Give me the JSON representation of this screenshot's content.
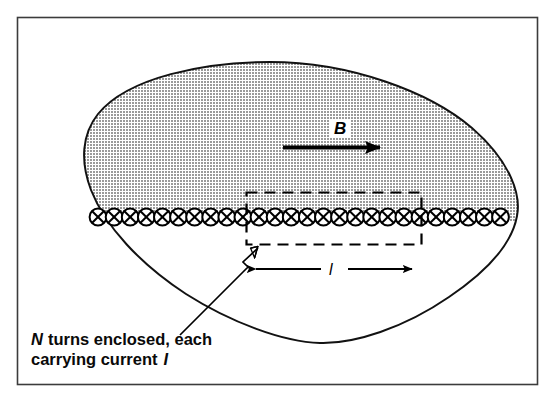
{
  "figure": {
    "kind": "physics-diagram",
    "frame": {
      "border_color": "#3c3c3c",
      "background_color": "#ffffff"
    },
    "region": {
      "name": "magnetic-field-region-blob",
      "fill_color": "#b0b0b0",
      "outline_color": "#1a1a1a"
    },
    "field_arrow": {
      "label": "B",
      "description": "magnetic field direction arrow pointing right",
      "color": "#000000"
    },
    "coil": {
      "name": "current-carrying-wires-into-page",
      "symbol": "⊗",
      "turn_count_visible": 26,
      "marker_color": "#000000"
    },
    "amperian_loop": {
      "name": "dashed-rectangular-path",
      "style": "dashed",
      "color": "#000000"
    },
    "length_dimension": {
      "label": "l",
      "description": "length of the amperian loop side",
      "color": "#000000"
    },
    "callout": {
      "line_1": "turns enclosed, each",
      "line_2": "carrying current",
      "symbol_n": "N",
      "symbol_i": "I",
      "full_text": "N turns enclosed, each carrying current I",
      "pointer_name": "callout-leader-arrow"
    }
  }
}
